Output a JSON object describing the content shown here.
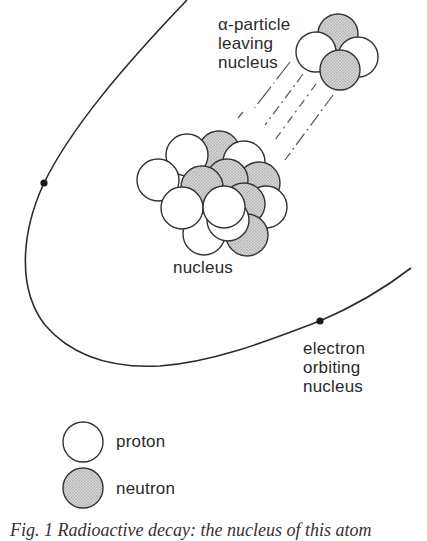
{
  "figure": {
    "labels": {
      "alpha_line1": "α-particle",
      "alpha_line2": "leaving",
      "alpha_line3": "nucleus",
      "nucleus": "nucleus",
      "electron_line1": "electron",
      "electron_line2": "orbiting",
      "electron_line3": "nucleus"
    },
    "legend": {
      "items": [
        {
          "symbol": "open-circle",
          "label": "proton"
        },
        {
          "symbol": "shaded-circle",
          "label": "neutron"
        }
      ]
    },
    "caption": "Fig. 1 Radioactive decay: the nucleus of this atom",
    "colors": {
      "proton_fill": "#ffffff",
      "neutron_fill": "#c8c8c8",
      "stroke": "#333333",
      "background": "#ffffff"
    }
  }
}
